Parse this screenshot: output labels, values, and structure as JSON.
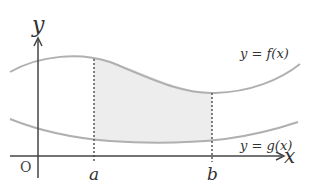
{
  "diagram": {
    "axes": {
      "x_label": "x",
      "y_label": "y",
      "origin_label": "O"
    },
    "curves": [
      {
        "name": "f",
        "label": "y = f(x)",
        "position": "upper"
      },
      {
        "name": "g",
        "label": "y = g(x)",
        "position": "lower"
      }
    ],
    "bounds": {
      "lower": "a",
      "upper": "b"
    },
    "shaded_region": "between f(x) and g(x) from x = a to x = b",
    "colors": {
      "curve": "#b0b0b0",
      "axis": "#444444",
      "shade": "#ededed",
      "dashed": "#555555"
    }
  }
}
